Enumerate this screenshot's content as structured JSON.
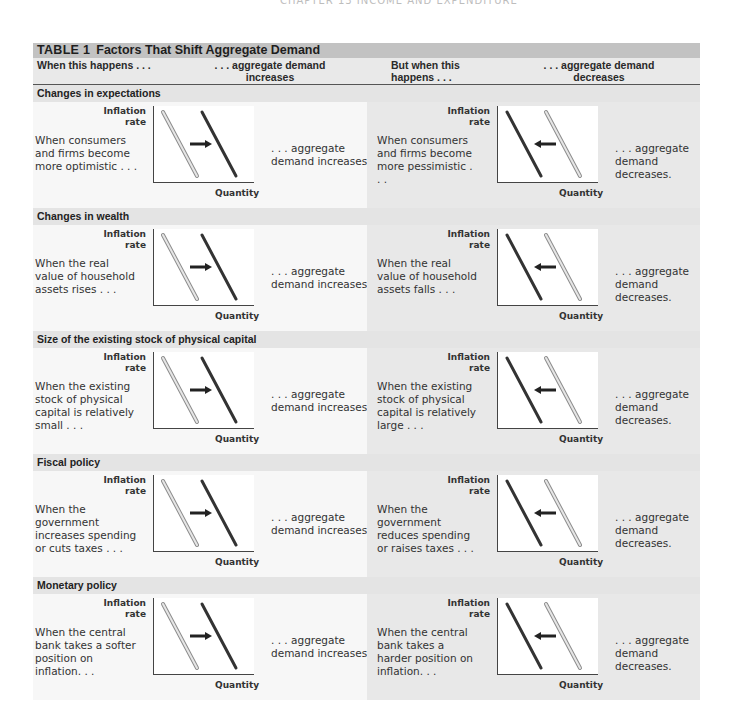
{
  "running_head": "CHAPTER 13    INCOME AND EXPENDITURE",
  "table": {
    "label": "TABLE 1",
    "title": "Factors That Shift Aggregate Demand",
    "columns": {
      "when_this_happens": "When this happens . . .",
      "ad_increases": ". . . aggregate demand increases",
      "but_when_this_happens": "But when this happens . . .",
      "ad_decreases": ". . . aggregate demand decreases"
    },
    "graph_labels": {
      "y_axis": "Inflation rate",
      "x_axis": "Quantity"
    },
    "colors": {
      "title_bar": "#c2c2c2",
      "header_band": "#e9e9e9",
      "left_panel": "#f7f7f7",
      "right_panel": "#e8e8e8",
      "original_curve": "#bdbdbd",
      "new_curve": "#333333"
    },
    "rows": [
      {
        "section": "Changes in expectations",
        "increase_cause": "When consumers and firms become more optimistic . . .",
        "increase_effect": ". . . aggregate demand increases.",
        "decrease_cause": "When consumers and firms become more pessimistic . . .",
        "decrease_effect": ". . . aggregate demand decreases."
      },
      {
        "section": "Changes in wealth",
        "increase_cause": "When the real value of household assets rises . . .",
        "increase_effect": ". . . aggregate demand increases.",
        "decrease_cause": "When the real value of household assets falls . . .",
        "decrease_effect": ". . . aggregate demand decreases."
      },
      {
        "section": "Size of the existing stock of physical capital",
        "increase_cause": "When the existing stock of physical capital is relatively small . . .",
        "increase_effect": ". . . aggregate demand increases.",
        "decrease_cause": "When the existing stock of physical capital is relatively large . . .",
        "decrease_effect": ". . . aggregate demand decreases."
      },
      {
        "section": "Fiscal policy",
        "increase_cause": "When the government increases spending or cuts taxes . . .",
        "increase_effect": ". . . aggregate demand increases.",
        "decrease_cause": "When the government reduces spending or raises taxes . . .",
        "decrease_effect": ". . . aggregate demand decreases."
      },
      {
        "section": "Monetary policy",
        "increase_cause": "When the central bank takes a softer position on inflation. . .",
        "increase_effect": ". . . aggregate demand increases.",
        "decrease_cause": "When the central bank takes a harder position on inflation. . .",
        "decrease_effect": ". . . aggregate demand decreases."
      }
    ]
  }
}
